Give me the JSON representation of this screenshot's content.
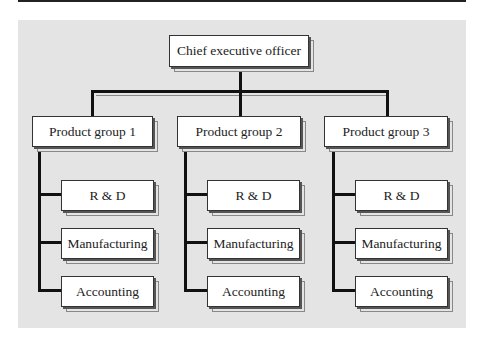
{
  "chart": {
    "top": {
      "label": "Chief executive officer"
    },
    "groups": [
      {
        "label": "Product group 1",
        "children": [
          {
            "label": "R & D"
          },
          {
            "label": "Manufacturing"
          },
          {
            "label": "Accounting"
          }
        ]
      },
      {
        "label": "Product group 2",
        "children": [
          {
            "label": "R & D"
          },
          {
            "label": "Manufacturing"
          },
          {
            "label": "Accounting"
          }
        ]
      },
      {
        "label": "Product group 3",
        "children": [
          {
            "label": "R & D"
          },
          {
            "label": "Manufacturing"
          },
          {
            "label": "Accounting"
          }
        ]
      }
    ]
  },
  "colors": {
    "panel": "#e4e4e4",
    "line": "#111111",
    "box": "#ffffff"
  }
}
